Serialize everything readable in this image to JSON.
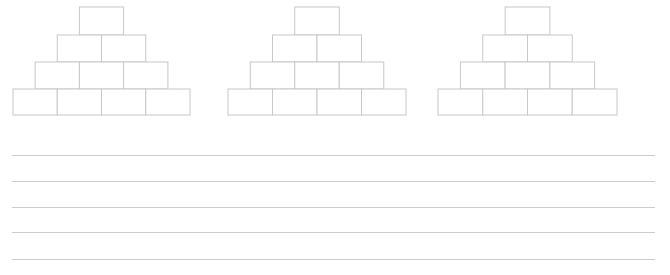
{
  "page": {
    "width": 670,
    "height": 275,
    "background_color": "#ffffff"
  },
  "style": {
    "stroke_color": "#c8c8c8",
    "stroke_color_lines": "#cccccc",
    "stroke_width": 1,
    "block_fill": "#ffffff"
  },
  "pyramids": [
    {
      "name": "pyramid-1",
      "left": 13,
      "top": 7,
      "block_width": 44.25,
      "row_height": 27,
      "rows": [
        {
          "index": 0,
          "count": 1,
          "y": 7,
          "height": 28
        },
        {
          "index": 1,
          "count": 2,
          "y": 35,
          "height": 27
        },
        {
          "index": 2,
          "count": 3,
          "y": 62,
          "height": 27
        },
        {
          "index": 3,
          "count": 4,
          "y": 89,
          "height": 26
        }
      ],
      "bottom_span": {
        "x1": 13,
        "x2": 190
      }
    },
    {
      "name": "pyramid-2",
      "left": 228,
      "top": 7,
      "block_width": 44.5,
      "row_height": 27,
      "rows": [
        {
          "index": 0,
          "count": 1,
          "y": 7,
          "height": 28
        },
        {
          "index": 1,
          "count": 2,
          "y": 35,
          "height": 27
        },
        {
          "index": 2,
          "count": 3,
          "y": 62,
          "height": 27
        },
        {
          "index": 3,
          "count": 4,
          "y": 89,
          "height": 26
        }
      ],
      "bottom_span": {
        "x1": 228,
        "x2": 406
      }
    },
    {
      "name": "pyramid-3",
      "left": 438,
      "top": 7,
      "block_width": 44.75,
      "row_height": 27,
      "rows": [
        {
          "index": 0,
          "count": 1,
          "y": 7,
          "height": 28
        },
        {
          "index": 1,
          "count": 2,
          "y": 35,
          "height": 27
        },
        {
          "index": 2,
          "count": 3,
          "y": 62,
          "height": 27
        },
        {
          "index": 3,
          "count": 4,
          "y": 89,
          "height": 26
        }
      ],
      "bottom_span": {
        "x1": 438,
        "x2": 617
      }
    }
  ],
  "ruled_lines": {
    "name": "writing-lines",
    "x_start": 12,
    "x_end": 655,
    "y_positions": [
      155,
      181,
      207,
      232,
      259
    ],
    "count": 5
  }
}
